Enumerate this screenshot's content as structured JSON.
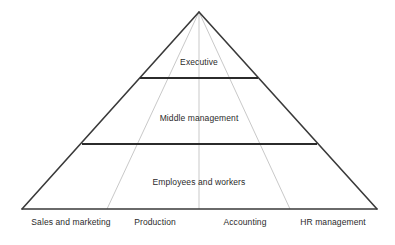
{
  "diagram": {
    "type": "organizational-pyramid",
    "title": "",
    "colors": {
      "background": "#ffffff",
      "outline": "#3a3a3a",
      "tier_divider": "#2b2b2b",
      "column_divider": "#c9c9c9",
      "text": "#2a2a2a"
    },
    "geometry": {
      "apex": {
        "x": 199,
        "y": 12
      },
      "base_left": {
        "x": 22,
        "y": 209
      },
      "base_right": {
        "x": 377,
        "y": 209
      },
      "tier_divider_y": [
        78,
        144
      ],
      "column_divider_base_x": [
        107,
        199,
        290
      ]
    },
    "tiers": [
      {
        "id": "executive",
        "label": "Executive",
        "level": 1,
        "center": {
          "x": 199,
          "y": 62
        }
      },
      {
        "id": "middle-management",
        "label": "Middle management",
        "level": 2,
        "center": {
          "x": 199,
          "y": 118
        }
      },
      {
        "id": "employees-and-workers",
        "label": "Employees and workers",
        "level": 3,
        "center": {
          "x": 199,
          "y": 182
        }
      }
    ],
    "columns": [
      {
        "id": "sales-and-marketing",
        "label": "Sales and marketing",
        "center": {
          "x": 71,
          "y": 222
        }
      },
      {
        "id": "production",
        "label": "Production",
        "center": {
          "x": 155,
          "y": 222
        }
      },
      {
        "id": "accounting",
        "label": "Accounting",
        "center": {
          "x": 245,
          "y": 222
        }
      },
      {
        "id": "hr-management",
        "label": "HR management",
        "center": {
          "x": 333,
          "y": 222
        }
      }
    ]
  }
}
